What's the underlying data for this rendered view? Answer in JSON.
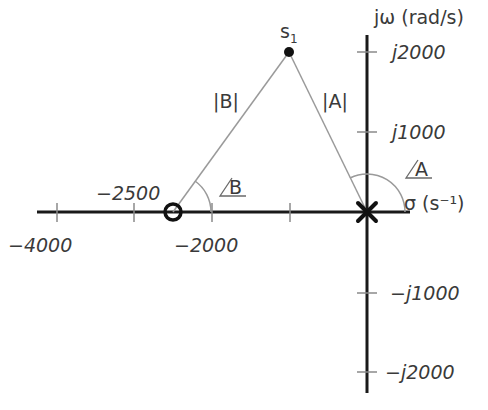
{
  "diagram": {
    "type": "s-plane pole-zero plot",
    "axes": {
      "vertical_label": "jω (rad/s)",
      "horizontal_label": "σ (s⁻¹)",
      "horizontal_ticks": [
        {
          "value": -4000,
          "label": "−4000"
        },
        {
          "value": -3000,
          "label": ""
        },
        {
          "value": -2000,
          "label": "−2000"
        },
        {
          "value": -1000,
          "label": ""
        }
      ],
      "vertical_ticks": [
        {
          "value": 2000,
          "label": "j2000"
        },
        {
          "value": 1000,
          "label": "j1000"
        },
        {
          "value": -1000,
          "label": "−j1000"
        },
        {
          "value": -2000,
          "label": "−j2000"
        }
      ]
    },
    "zero": {
      "sigma": -2500,
      "omega": 0,
      "label": "−2500",
      "marker": "circle"
    },
    "pole": {
      "sigma": 0,
      "omega": 0,
      "marker": "cross"
    },
    "point": {
      "sigma": -1000,
      "omega": 2000,
      "label": "s",
      "subscript": "1"
    },
    "vectors": {
      "A": {
        "magnitude_label": "|A|",
        "angle_label": "A"
      },
      "B": {
        "magnitude_label": "|B|",
        "angle_label": "B"
      }
    },
    "colors": {
      "axis": "#1a1a1a",
      "vector": "#9a9a9a",
      "text": "#3a3a3a",
      "tick": "#8a8a8a"
    }
  }
}
